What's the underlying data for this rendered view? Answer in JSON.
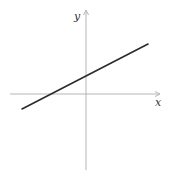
{
  "chart_data": {
    "type": "line",
    "title": "",
    "xlabel": "x",
    "ylabel": "y",
    "grid": false,
    "legend": null,
    "axes": {
      "origin_px": [
        86,
        94
      ],
      "x_axis": {
        "from_px": 10,
        "to_px": 160,
        "arrow": true,
        "color": "#b5b5b5"
      },
      "y_axis": {
        "from_px": 170,
        "to_px": 10,
        "arrow": true,
        "color": "#b5b5b5"
      },
      "ticks": "none"
    },
    "series": [
      {
        "name": "line",
        "color": "#2b2b2b",
        "points_px": [
          [
            22,
            109
          ],
          [
            148,
            44
          ]
        ],
        "description": "Straight line with positive slope (~0.5) and positive y-intercept; crosses x-axis left of origin",
        "approx_equation": "y = 0.5x + 1 (schematic units)"
      }
    ]
  },
  "labels": {
    "x_axis": "x",
    "y_axis": "y"
  },
  "colors": {
    "axis": "#b5b5b5",
    "line": "#2b2b2b",
    "label": "#333333",
    "background": "#ffffff"
  }
}
